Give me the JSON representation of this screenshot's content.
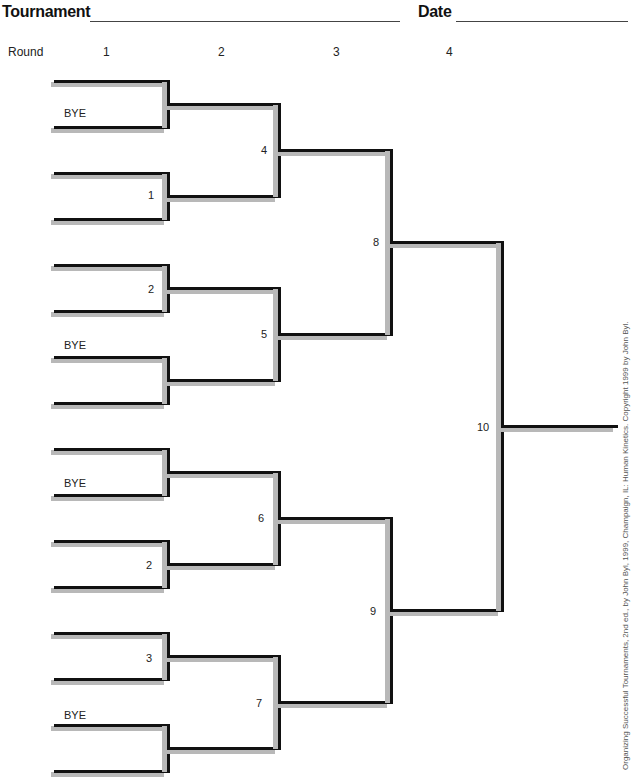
{
  "header": {
    "tournament_label": "Tournament",
    "date_label": "Date"
  },
  "rounds": {
    "label": "Round",
    "numbers": [
      "1",
      "2",
      "3",
      "4"
    ]
  },
  "bracket": {
    "round1_labels": [
      {
        "text": "BYE",
        "x": 64,
        "y": 107
      },
      {
        "text": "1",
        "x": 148,
        "y": 189
      },
      {
        "text": "2",
        "x": 148,
        "y": 283
      },
      {
        "text": "BYE",
        "x": 64,
        "y": 339
      },
      {
        "text": "BYE",
        "x": 64,
        "y": 477
      },
      {
        "text": "2",
        "x": 146,
        "y": 559
      },
      {
        "text": "3",
        "x": 146,
        "y": 652
      },
      {
        "text": "BYE",
        "x": 64,
        "y": 709
      }
    ],
    "game_numbers": [
      {
        "text": "4",
        "x": 261,
        "y": 144
      },
      {
        "text": "5",
        "x": 261,
        "y": 328
      },
      {
        "text": "6",
        "x": 258,
        "y": 512
      },
      {
        "text": "7",
        "x": 256,
        "y": 697
      },
      {
        "text": "8",
        "x": 373,
        "y": 236
      },
      {
        "text": "9",
        "x": 370,
        "y": 605
      },
      {
        "text": "10",
        "x": 477,
        "y": 421
      }
    ]
  },
  "credit": "Organizing Successful Tournaments, 2nd ed., by John Byl, 1999, Champaign, IL: Human Kinetics. Copyright 1999 by John Byl."
}
